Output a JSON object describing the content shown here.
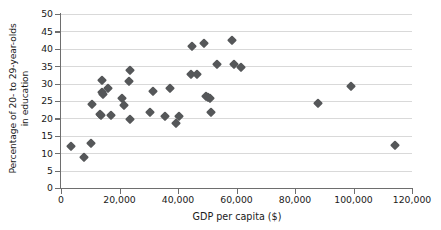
{
  "chart_data": {
    "type": "scatter",
    "title": "",
    "xlabel": "GDP per capita ($)",
    "ylabel": "Percentage of 20- to 29-year-olds in education",
    "ylabel_line1": "Percentage of 20- to 29-year-olds",
    "ylabel_line2": "in education",
    "xlim": [
      0,
      120000
    ],
    "ylim": [
      0,
      50
    ],
    "xticks": [
      0,
      20000,
      40000,
      60000,
      80000,
      100000,
      120000
    ],
    "xtick_labels": [
      "0",
      "20,000",
      "40,000",
      "60,000",
      "80,000",
      "100,000",
      "120,000"
    ],
    "yticks": [
      0,
      5,
      10,
      15,
      20,
      25,
      30,
      35,
      40,
      45,
      50
    ],
    "ytick_labels": [
      "0",
      "5",
      "10",
      "15",
      "20",
      "25",
      "30",
      "35",
      "40",
      "45",
      "50"
    ],
    "grid": "horizontal",
    "legend": "none",
    "marker": "diamond",
    "marker_color": "#555759",
    "grid_color": "#d9d9d9",
    "axis_color": "#6e6e6e",
    "points": [
      {
        "x": 3500,
        "y": 12.0
      },
      {
        "x": 8000,
        "y": 9.0
      },
      {
        "x": 10300,
        "y": 13.0
      },
      {
        "x": 10600,
        "y": 24.0
      },
      {
        "x": 13200,
        "y": 21.3
      },
      {
        "x": 13600,
        "y": 20.9
      },
      {
        "x": 13900,
        "y": 31.0
      },
      {
        "x": 14000,
        "y": 27.6
      },
      {
        "x": 14300,
        "y": 27.1
      },
      {
        "x": 15900,
        "y": 28.7
      },
      {
        "x": 17200,
        "y": 20.9
      },
      {
        "x": 21000,
        "y": 25.9
      },
      {
        "x": 21400,
        "y": 23.9
      },
      {
        "x": 23100,
        "y": 30.8
      },
      {
        "x": 23500,
        "y": 33.9
      },
      {
        "x": 23700,
        "y": 19.8
      },
      {
        "x": 30300,
        "y": 21.9
      },
      {
        "x": 31400,
        "y": 27.8
      },
      {
        "x": 35700,
        "y": 20.8
      },
      {
        "x": 37300,
        "y": 28.8
      },
      {
        "x": 39200,
        "y": 18.7
      },
      {
        "x": 40300,
        "y": 20.7
      },
      {
        "x": 44400,
        "y": 32.8
      },
      {
        "x": 44900,
        "y": 40.7
      },
      {
        "x": 46500,
        "y": 32.8
      },
      {
        "x": 49000,
        "y": 41.7
      },
      {
        "x": 49600,
        "y": 26.5
      },
      {
        "x": 50400,
        "y": 26.2
      },
      {
        "x": 50900,
        "y": 25.8
      },
      {
        "x": 51200,
        "y": 21.7
      },
      {
        "x": 53400,
        "y": 35.6
      },
      {
        "x": 58600,
        "y": 42.6
      },
      {
        "x": 59300,
        "y": 35.6
      },
      {
        "x": 61600,
        "y": 34.7
      },
      {
        "x": 88000,
        "y": 24.5
      },
      {
        "x": 99200,
        "y": 29.4
      },
      {
        "x": 114300,
        "y": 12.3
      }
    ]
  }
}
